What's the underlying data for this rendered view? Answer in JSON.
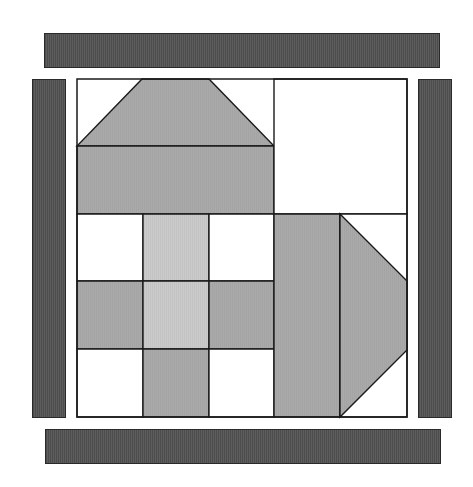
{
  "diagram": {
    "type": "quilt-block",
    "colors": {
      "background": "#ffffff",
      "border_strip": "#555555",
      "medium_gray": "#aaaaaa",
      "light_gray": "#c9c9c9",
      "white": "#ffffff",
      "outline": "#1a1a1a"
    },
    "border_strips": [
      {
        "name": "top",
        "x": 44,
        "y": 33,
        "w": 396,
        "h": 35
      },
      {
        "name": "left",
        "x": 32,
        "y": 79,
        "w": 34,
        "h": 339
      },
      {
        "name": "right",
        "x": 418,
        "y": 79,
        "w": 34,
        "h": 339
      },
      {
        "name": "bottom",
        "x": 45,
        "y": 429,
        "w": 396,
        "h": 35
      }
    ],
    "block": {
      "x": 77,
      "y": 79,
      "w": 330,
      "h": 338
    },
    "pieces": [
      {
        "name": "roof-trapezoid",
        "fill": "medium_gray",
        "points": "142,79 209,79 274,146 77,146"
      },
      {
        "name": "house-body",
        "fill": "medium_gray",
        "points": "77,146 274,146 274,214 77,214"
      },
      {
        "name": "top-right-square",
        "fill": "white",
        "points": "274,79 407,79 407,214 274,214"
      },
      {
        "name": "nine-patch-r1c1",
        "fill": "white",
        "points": "77,214 143,214 143,281 77,281"
      },
      {
        "name": "nine-patch-r1c2",
        "fill": "light_gray",
        "points": "143,214 209,214 209,281 143,281"
      },
      {
        "name": "nine-patch-r1c3",
        "fill": "white",
        "points": "209,214 274,214 274,281 209,281"
      },
      {
        "name": "nine-patch-r2c1",
        "fill": "medium_gray",
        "points": "77,281 143,281 143,349 77,349"
      },
      {
        "name": "nine-patch-r2c2",
        "fill": "light_gray",
        "points": "143,281 209,281 209,349 143,349"
      },
      {
        "name": "nine-patch-r2c3",
        "fill": "medium_gray",
        "points": "209,281 274,281 274,349 209,349"
      },
      {
        "name": "nine-patch-r3c1",
        "fill": "white",
        "points": "77,349 143,349 143,417 77,417"
      },
      {
        "name": "nine-patch-r3c2",
        "fill": "medium_gray",
        "points": "143,349 209,349 209,417 143,417"
      },
      {
        "name": "nine-patch-r3c3",
        "fill": "white",
        "points": "209,349 274,349 274,417 209,417"
      },
      {
        "name": "right-column-rect",
        "fill": "medium_gray",
        "points": "274,214 340,214 340,417 274,417"
      },
      {
        "name": "right-corner-white",
        "fill": "white",
        "points": "340,214 407,214 407,417 340,417"
      },
      {
        "name": "arrow-trapezoid",
        "fill": "medium_gray",
        "points": "340,214 407,281 407,350 340,417"
      }
    ]
  }
}
